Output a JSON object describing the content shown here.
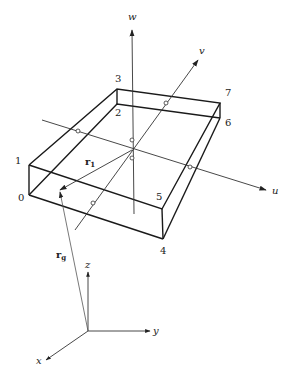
{
  "figure": {
    "local_axes": {
      "w": {
        "label": "w"
      },
      "v": {
        "label": "v"
      },
      "u": {
        "label": "u"
      }
    },
    "global_axes": {
      "x": {
        "label": "x"
      },
      "y": {
        "label": "y"
      },
      "z": {
        "label": "z"
      }
    },
    "vertices": [
      {
        "id": "0",
        "label": "0"
      },
      {
        "id": "1",
        "label": "1"
      },
      {
        "id": "2",
        "label": "2"
      },
      {
        "id": "3",
        "label": "3"
      },
      {
        "id": "4",
        "label": "4"
      },
      {
        "id": "5",
        "label": "5"
      },
      {
        "id": "6",
        "label": "6"
      },
      {
        "id": "7",
        "label": "7"
      }
    ],
    "vectors": {
      "r1": {
        "base": "r",
        "sub": "1"
      },
      "rg": {
        "base": "r",
        "sub": "g"
      }
    }
  }
}
